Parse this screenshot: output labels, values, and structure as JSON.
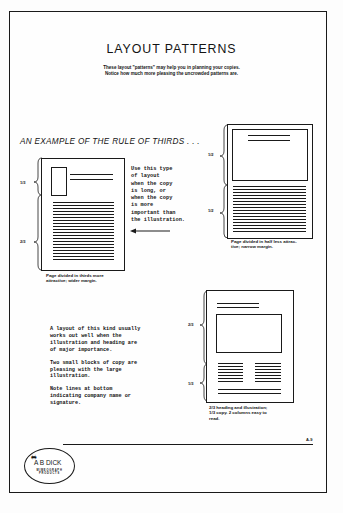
{
  "page": {
    "title": "LAYOUT PATTERNS",
    "subtitle_lines": [
      "These layout \"patterns\" may help you in planning your copies.",
      "Notice how much more pleasing the uncrowded patterns are."
    ],
    "section_heading": "AN EXAMPLE OF THE RULE OF THIRDS . . .",
    "page_number": "A-9"
  },
  "example_thirds": {
    "bracket_labels": [
      "1/3",
      "2/3"
    ],
    "side_note_lines": [
      "Use this type",
      "of layout",
      "when the copy",
      "is long, or",
      "when the copy",
      "is more",
      "important than",
      "the illustration."
    ],
    "arrow_icon": "left-arrow",
    "caption_lines": [
      "Page divided in thirds more",
      "attractive; wider margin."
    ]
  },
  "example_halves": {
    "bracket_labels": [
      "1/2",
      "1/2"
    ],
    "caption_lines": [
      "Page divided in half less attrac-",
      "tive; narrow margin."
    ]
  },
  "example_two_columns": {
    "bracket_labels": [
      "2/3",
      "1/3"
    ],
    "note_paragraphs": [
      "A layout of this kind usually works out well when the illustration and heading are of major importance.",
      "Two small blocks of copy are pleasing with the large illustration.",
      "Note lines at bottom indicating company name or signature."
    ],
    "caption_lines": [
      "2/3 heading and illustration;",
      "1/3 copy. 2 columns easy to",
      "read."
    ]
  },
  "logo": {
    "icon": "mimeograph-icon",
    "name": "A B DICK",
    "sub_lines": [
      "MIMEOGRAPH",
      "PRODUCTS"
    ]
  }
}
